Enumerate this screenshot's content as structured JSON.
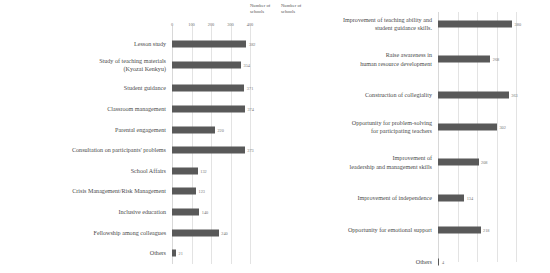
{
  "axis_caption": "Number of\nschools",
  "chart_data": [
    {
      "type": "bar",
      "orientation": "horizontal",
      "title": "",
      "xlabel": "Number of schools",
      "ylabel": "",
      "xlim": [
        0,
        400
      ],
      "ticks": [
        "0",
        "100",
        "200",
        "300",
        "400"
      ],
      "tick_values": [
        0,
        100,
        200,
        300,
        400
      ],
      "grid": true,
      "bar_color": "#595959",
      "panel": "left",
      "categories": [
        "Lesson study",
        "Study of teaching materials\n(Kyozai Kenkyu)",
        "Student guidance",
        "Classroom management",
        "Parental engagement",
        "Consultation on participants' problems",
        "School Affairs",
        "Crisis Management/Risk Management",
        "Inclusive education",
        "Fellowship among colleagues",
        "Others"
      ],
      "values": [
        382,
        354,
        371,
        374,
        220,
        373,
        132,
        123,
        140,
        240,
        21
      ],
      "value_labels": [
        "382",
        "354",
        "371",
        "374",
        "220",
        "373",
        "132",
        "123",
        "140",
        "240",
        "21"
      ]
    },
    {
      "type": "bar",
      "orientation": "horizontal",
      "title": "",
      "xlabel": "Number of schools",
      "ylabel": "",
      "xlim": [
        0,
        400
      ],
      "ticks": [
        "0",
        "100",
        "200",
        "300",
        "400"
      ],
      "tick_values": [
        0,
        100,
        200,
        300,
        400
      ],
      "grid": true,
      "bar_color": "#595959",
      "panel": "right",
      "categories": [
        "Improvement of teaching ability and\nstudent guidance skills.",
        "Raise awareness in\nhuman resource development",
        "Construction of collegiality",
        "Opportunity for problem-solving\nfor participating teachers",
        "Improvement of\nleadership and management skills",
        "Improvement of independence",
        "Opportunity for emotional support",
        "Others"
      ],
      "values": [
        380,
        268,
        363,
        302,
        208,
        134,
        218,
        4
      ],
      "value_labels": [
        "380",
        "268",
        "363",
        "302",
        "208",
        "134",
        "218",
        "4"
      ]
    }
  ]
}
